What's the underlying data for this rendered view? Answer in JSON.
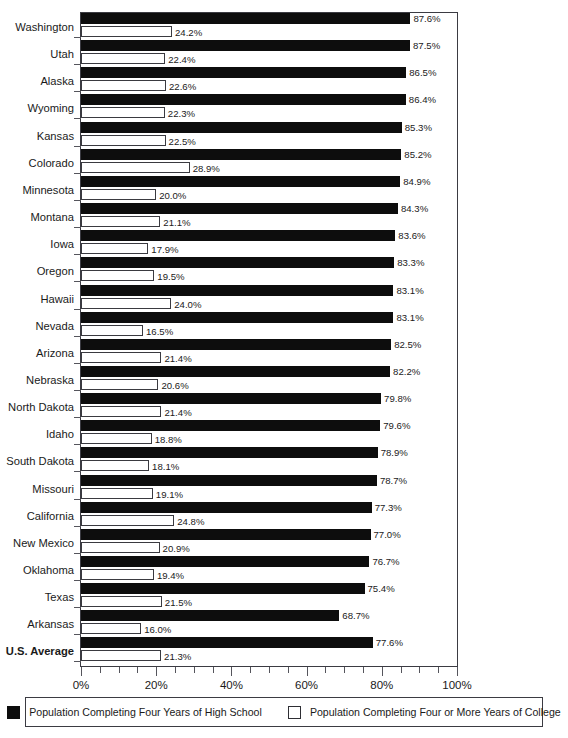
{
  "chart_data": {
    "type": "bar",
    "orientation": "horizontal",
    "title": "",
    "xlabel": "",
    "ylabel": "",
    "xlim": [
      0,
      100
    ],
    "xticks": [
      "0%",
      "20%",
      "40%",
      "60%",
      "80%",
      "100%"
    ],
    "xtick_values": [
      0,
      20,
      40,
      60,
      80,
      100
    ],
    "grid": false,
    "legend_position": "bottom",
    "categories": [
      "Washington",
      "Utah",
      "Alaska",
      "Wyoming",
      "Kansas",
      "Colorado",
      "Minnesota",
      "Montana",
      "Iowa",
      "Oregon",
      "Hawaii",
      "Nevada",
      "Arizona",
      "Nebraska",
      "North Dakota",
      "Idaho",
      "South Dakota",
      "Missouri",
      "California",
      "New Mexico",
      "Oklahoma",
      "Texas",
      "Arkansas",
      "U.S. Average"
    ],
    "emphasized_categories": [
      "U.S. Average"
    ],
    "series": [
      {
        "name": "Population Completing Four Years of High School",
        "color": "#0d0d0d",
        "values": [
          87.6,
          87.5,
          86.5,
          86.4,
          85.3,
          85.2,
          84.9,
          84.3,
          83.6,
          83.3,
          83.1,
          83.1,
          82.5,
          82.2,
          79.8,
          79.6,
          78.9,
          78.7,
          77.3,
          77.0,
          76.7,
          75.4,
          68.7,
          77.6
        ],
        "labels": [
          "87.6%",
          "87.5%",
          "86.5%",
          "86.4%",
          "85.3%",
          "85.2%",
          "84.9%",
          "84.3%",
          "83.6%",
          "83.3%",
          "83.1%",
          "83.1%",
          "82.5%",
          "82.2%",
          "79.8%",
          "79.6%",
          "78.9%",
          "78.7%",
          "77.3%",
          "77.0%",
          "76.7%",
          "75.4%",
          "68.7%",
          "77.6%"
        ]
      },
      {
        "name": "Population Completing Four or More Years of College",
        "color": "#ffffff",
        "values": [
          24.2,
          22.4,
          22.6,
          22.3,
          22.5,
          28.9,
          20.0,
          21.1,
          17.9,
          19.5,
          24.0,
          16.5,
          21.4,
          20.6,
          21.4,
          18.8,
          18.1,
          19.1,
          24.8,
          20.9,
          19.4,
          21.5,
          16.0,
          21.3
        ],
        "labels": [
          "24.2%",
          "22.4%",
          "22.6%",
          "22.3%",
          "22.5%",
          "28.9%",
          "20.0%",
          "21.1%",
          "17.9%",
          "19.5%",
          "24.0%",
          "16.5%",
          "21.4%",
          "20.6%",
          "21.4%",
          "18.8%",
          "18.1%",
          "19.1%",
          "24.8%",
          "20.9%",
          "19.4%",
          "21.5%",
          "16.0%",
          "21.3%"
        ]
      }
    ]
  },
  "legend": {
    "items": [
      {
        "label": "Population Completing Four Years of High School",
        "swatch": "filled-square-icon"
      },
      {
        "label": "Population Completing Four or More Years of College",
        "swatch": "hollow-square-icon"
      }
    ]
  }
}
